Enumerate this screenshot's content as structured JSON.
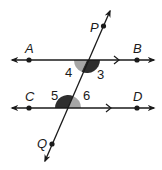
{
  "diagram": {
    "type": "parallel-lines-cut-by-transversal",
    "colors": {
      "line": "#1a1a1a",
      "angle_dark": "#2e2e2e",
      "angle_light": "#a6a6a6",
      "background": "#ffffff"
    },
    "lines": [
      {
        "name": "AB",
        "y": 60,
        "points": [
          {
            "label": "A",
            "x": 29
          },
          {
            "label": "B",
            "x": 137
          }
        ],
        "parallel_marker_x": 118
      },
      {
        "name": "CD",
        "y": 108,
        "points": [
          {
            "label": "C",
            "x": 29
          },
          {
            "label": "D",
            "x": 137
          }
        ],
        "parallel_marker_x": 110
      }
    ],
    "transversal": {
      "name": "PQ",
      "points": [
        {
          "label": "P"
        },
        {
          "label": "Q"
        }
      ]
    },
    "angles": [
      {
        "number": "3",
        "position": "below AB, right of transversal",
        "shade": "dark"
      },
      {
        "number": "4",
        "position": "below AB, left of transversal",
        "shade": "light"
      },
      {
        "number": "5",
        "position": "above CD, left of transversal",
        "shade": "dark"
      },
      {
        "number": "6",
        "position": "above CD, right of transversal",
        "shade": "light"
      }
    ],
    "labels": {
      "A": "A",
      "B": "B",
      "C": "C",
      "D": "D",
      "P": "P",
      "Q": "Q",
      "angle3": "3",
      "angle4": "4",
      "angle5": "5",
      "angle6": "6"
    }
  }
}
